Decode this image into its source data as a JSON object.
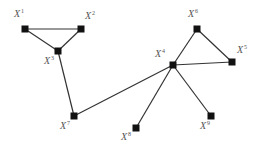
{
  "diagram": {
    "type": "undirected-graph",
    "node_color": "#111111",
    "edge_color": "#333333",
    "label_color": "#555555",
    "nodes": [
      {
        "id": "1",
        "base": "X",
        "sup": "1",
        "label": "X1"
      },
      {
        "id": "2",
        "base": "X",
        "sup": "2",
        "label": "X2"
      },
      {
        "id": "3",
        "base": "X",
        "sup": "3",
        "label": "X3"
      },
      {
        "id": "4",
        "base": "X",
        "sup": "4",
        "label": "X4"
      },
      {
        "id": "5",
        "base": "X",
        "sup": "5",
        "label": "X5"
      },
      {
        "id": "6",
        "base": "X",
        "sup": "6",
        "label": "X6"
      },
      {
        "id": "7",
        "base": "X",
        "sup": "7",
        "label": "X7"
      },
      {
        "id": "8",
        "base": "X",
        "sup": "8",
        "label": "X8"
      },
      {
        "id": "9",
        "base": "X",
        "sup": "9",
        "label": "X9"
      }
    ],
    "edges": [
      {
        "from": "1",
        "to": "2"
      },
      {
        "from": "1",
        "to": "3"
      },
      {
        "from": "2",
        "to": "3"
      },
      {
        "from": "3",
        "to": "7"
      },
      {
        "from": "7",
        "to": "4"
      },
      {
        "from": "4",
        "to": "6"
      },
      {
        "from": "6",
        "to": "5"
      },
      {
        "from": "4",
        "to": "5"
      },
      {
        "from": "4",
        "to": "8"
      },
      {
        "from": "4",
        "to": "9"
      }
    ]
  }
}
